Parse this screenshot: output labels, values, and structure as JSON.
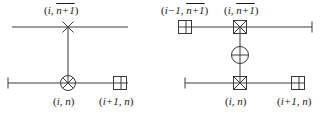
{
  "figure": {
    "type": "stencil-diagram",
    "stroke_color": "#3a3a3a",
    "text_color": "#1a1a1a",
    "background": "#ffffff",
    "panels": [
      {
        "id": "left-stencil",
        "nodes": [
          {
            "id": "left-top-node",
            "marker": "x-marker",
            "label_open": "(",
            "label_base": "i, ",
            "label_over": "n+1",
            "label_close": ")",
            "label_position": "above"
          },
          {
            "id": "left-center-node",
            "marker": "circled-x-marker",
            "label_open": "(",
            "label_base": "i, n",
            "label_over": "",
            "label_close": ")",
            "label_position": "below"
          },
          {
            "id": "left-right-node",
            "marker": "split-square-marker",
            "label_open": "(",
            "label_base": "i+1, n",
            "label_over": "",
            "label_close": ")",
            "label_position": "below"
          }
        ]
      },
      {
        "id": "right-stencil",
        "nodes": [
          {
            "id": "right-topleft-node",
            "marker": "split-square-marker",
            "label_open": "(",
            "label_base": "i−1, ",
            "label_over": "n+1",
            "label_close": ")",
            "label_position": "above"
          },
          {
            "id": "right-topmid-node",
            "marker": "boxed-x-marker",
            "label_open": "(",
            "label_base": "i, ",
            "label_over": "n+1",
            "label_close": ")",
            "label_position": "above"
          },
          {
            "id": "right-middle-node",
            "marker": "circled-plus-marker",
            "label_open": "",
            "label_base": "",
            "label_over": "",
            "label_close": "",
            "label_position": "none"
          },
          {
            "id": "right-bottommid-node",
            "marker": "boxed-x-marker",
            "label_open": "(",
            "label_base": "i, n",
            "label_over": "",
            "label_close": ")",
            "label_position": "below"
          },
          {
            "id": "right-bottomright-node",
            "marker": "split-square-marker",
            "label_open": "(",
            "label_base": "i+1, n",
            "label_over": "",
            "label_close": ")",
            "label_position": "below"
          }
        ]
      }
    ]
  }
}
